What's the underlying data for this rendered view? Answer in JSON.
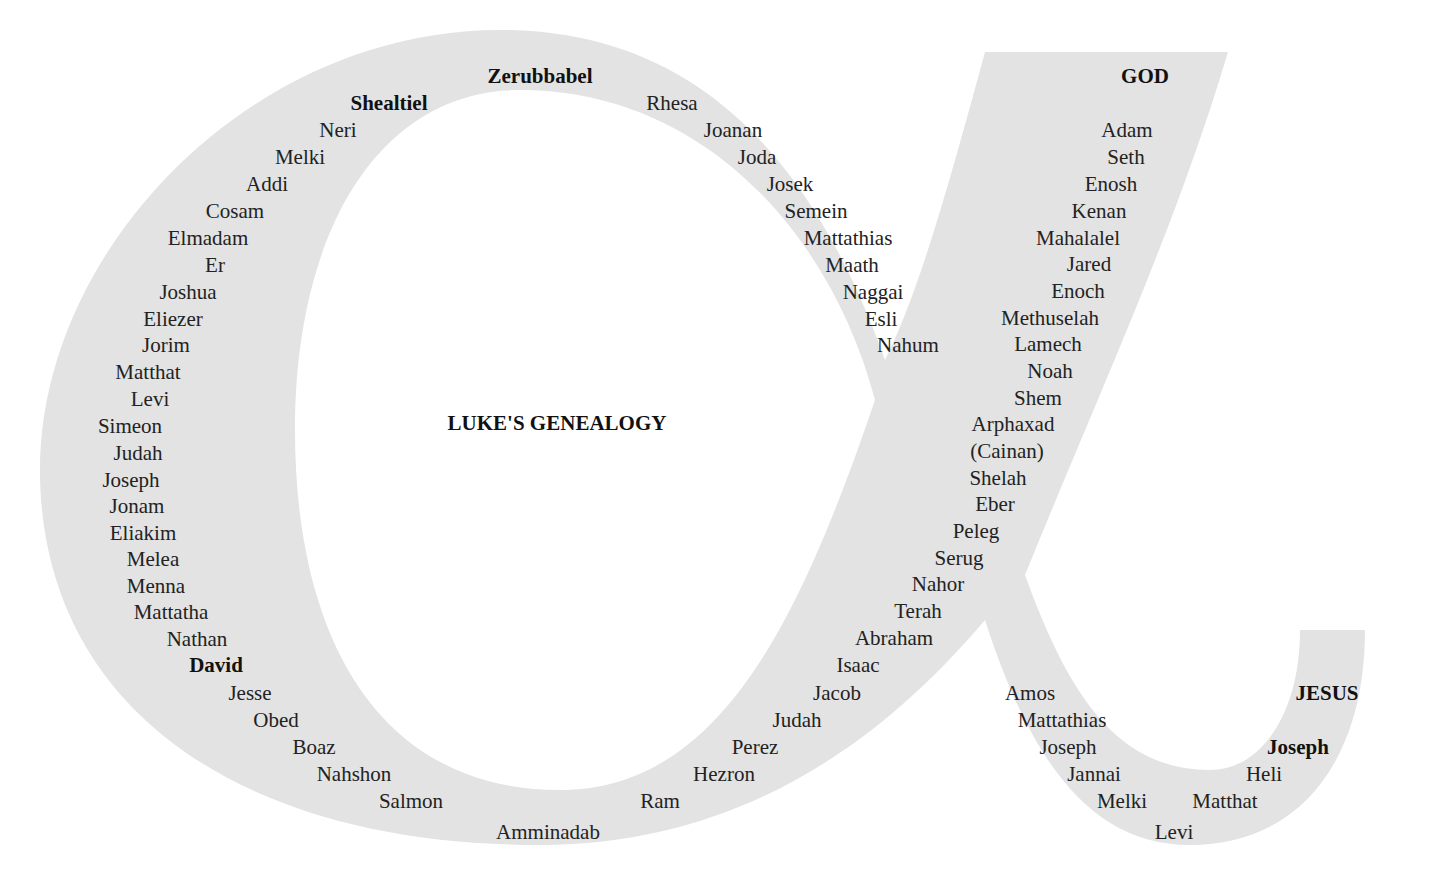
{
  "title": "LUKE'S GENEALOGY",
  "colors": {
    "shape": "#e3e3e3",
    "background": "#ffffff",
    "text": "#222222"
  },
  "names": [
    {
      "text": "Zerubbabel",
      "x": 540,
      "y": 64,
      "bold": true
    },
    {
      "text": "Shealtiel",
      "x": 389,
      "y": 91,
      "bold": true
    },
    {
      "text": "Rhesa",
      "x": 672,
      "y": 91,
      "bold": false
    },
    {
      "text": "Neri",
      "x": 338,
      "y": 118,
      "bold": false
    },
    {
      "text": "Joanan",
      "x": 733,
      "y": 118,
      "bold": false
    },
    {
      "text": "Melki",
      "x": 300,
      "y": 145,
      "bold": false
    },
    {
      "text": "Joda",
      "x": 757,
      "y": 145,
      "bold": false
    },
    {
      "text": "Addi",
      "x": 267,
      "y": 172,
      "bold": false
    },
    {
      "text": "Josek",
      "x": 790,
      "y": 172,
      "bold": false
    },
    {
      "text": "Cosam",
      "x": 235,
      "y": 199,
      "bold": false
    },
    {
      "text": "Semein",
      "x": 816,
      "y": 199,
      "bold": false
    },
    {
      "text": "Elmadam",
      "x": 208,
      "y": 226,
      "bold": false
    },
    {
      "text": "Mattathias",
      "x": 848,
      "y": 226,
      "bold": false
    },
    {
      "text": "Er",
      "x": 215,
      "y": 253,
      "bold": false
    },
    {
      "text": "Maath",
      "x": 852,
      "y": 253,
      "bold": false
    },
    {
      "text": "Joshua",
      "x": 188,
      "y": 280,
      "bold": false
    },
    {
      "text": "Naggai",
      "x": 873,
      "y": 280,
      "bold": false
    },
    {
      "text": "Eliezer",
      "x": 173,
      "y": 307,
      "bold": false
    },
    {
      "text": "Esli",
      "x": 881,
      "y": 307,
      "bold": false
    },
    {
      "text": "Jorim",
      "x": 166,
      "y": 333,
      "bold": false
    },
    {
      "text": "Nahum",
      "x": 908,
      "y": 333,
      "bold": false
    },
    {
      "text": "Matthat",
      "x": 148,
      "y": 360,
      "bold": false
    },
    {
      "text": "Levi",
      "x": 150,
      "y": 387,
      "bold": false
    },
    {
      "text": "Simeon",
      "x": 130,
      "y": 414,
      "bold": false
    },
    {
      "text": "Judah",
      "x": 138,
      "y": 441,
      "bold": false
    },
    {
      "text": "Joseph",
      "x": 131,
      "y": 468,
      "bold": false
    },
    {
      "text": "Jonam",
      "x": 137,
      "y": 494,
      "bold": false
    },
    {
      "text": "Eliakim",
      "x": 143,
      "y": 521,
      "bold": false
    },
    {
      "text": "Melea",
      "x": 153,
      "y": 547,
      "bold": false
    },
    {
      "text": "Menna",
      "x": 156,
      "y": 574,
      "bold": false
    },
    {
      "text": "Mattatha",
      "x": 171,
      "y": 600,
      "bold": false
    },
    {
      "text": "Nathan",
      "x": 197,
      "y": 627,
      "bold": false
    },
    {
      "text": "David",
      "x": 216,
      "y": 653,
      "bold": true
    },
    {
      "text": "Jesse",
      "x": 250,
      "y": 681,
      "bold": false
    },
    {
      "text": "Obed",
      "x": 276,
      "y": 708,
      "bold": false
    },
    {
      "text": "Boaz",
      "x": 314,
      "y": 735,
      "bold": false
    },
    {
      "text": "Nahshon",
      "x": 354,
      "y": 762,
      "bold": false
    },
    {
      "text": "Salmon",
      "x": 411,
      "y": 789,
      "bold": false
    },
    {
      "text": "Amminadab",
      "x": 548,
      "y": 820,
      "bold": false
    },
    {
      "text": "Ram",
      "x": 660,
      "y": 789,
      "bold": false
    },
    {
      "text": "Hezron",
      "x": 724,
      "y": 762,
      "bold": false
    },
    {
      "text": "Perez",
      "x": 755,
      "y": 735,
      "bold": false
    },
    {
      "text": "Judah",
      "x": 797,
      "y": 708,
      "bold": false
    },
    {
      "text": "Jacob",
      "x": 837,
      "y": 681,
      "bold": false
    },
    {
      "text": "Isaac",
      "x": 858,
      "y": 653,
      "bold": false
    },
    {
      "text": "Abraham",
      "x": 894,
      "y": 626,
      "bold": false
    },
    {
      "text": "Terah",
      "x": 918,
      "y": 599,
      "bold": false
    },
    {
      "text": "Nahor",
      "x": 938,
      "y": 572,
      "bold": false
    },
    {
      "text": "Serug",
      "x": 959,
      "y": 546,
      "bold": false
    },
    {
      "text": "Peleg",
      "x": 976,
      "y": 519,
      "bold": false
    },
    {
      "text": "Eber",
      "x": 995,
      "y": 492,
      "bold": false
    },
    {
      "text": "Shelah",
      "x": 998,
      "y": 466,
      "bold": false
    },
    {
      "text": "(Cainan)",
      "x": 1007,
      "y": 439,
      "bold": false
    },
    {
      "text": "Arphaxad",
      "x": 1013,
      "y": 412,
      "bold": false
    },
    {
      "text": "Shem",
      "x": 1038,
      "y": 386,
      "bold": false
    },
    {
      "text": "Noah",
      "x": 1050,
      "y": 359,
      "bold": false
    },
    {
      "text": "Lamech",
      "x": 1048,
      "y": 332,
      "bold": false
    },
    {
      "text": "Methuselah",
      "x": 1050,
      "y": 306,
      "bold": false
    },
    {
      "text": "Enoch",
      "x": 1078,
      "y": 279,
      "bold": false
    },
    {
      "text": "Jared",
      "x": 1089,
      "y": 252,
      "bold": false
    },
    {
      "text": "Mahalalel",
      "x": 1078,
      "y": 226,
      "bold": false
    },
    {
      "text": "Kenan",
      "x": 1099,
      "y": 199,
      "bold": false
    },
    {
      "text": "Enosh",
      "x": 1111,
      "y": 172,
      "bold": false
    },
    {
      "text": "Seth",
      "x": 1126,
      "y": 145,
      "bold": false
    },
    {
      "text": "Adam",
      "x": 1127,
      "y": 118,
      "bold": false
    },
    {
      "text": "GOD",
      "x": 1145,
      "y": 64,
      "bold": true
    },
    {
      "text": "Amos",
      "x": 1030,
      "y": 681,
      "bold": false
    },
    {
      "text": "Mattathias",
      "x": 1062,
      "y": 708,
      "bold": false
    },
    {
      "text": "Joseph",
      "x": 1068,
      "y": 735,
      "bold": false
    },
    {
      "text": "Jannai",
      "x": 1094,
      "y": 762,
      "bold": false
    },
    {
      "text": "Melki",
      "x": 1122,
      "y": 789,
      "bold": false
    },
    {
      "text": "Levi",
      "x": 1174,
      "y": 820,
      "bold": false
    },
    {
      "text": "Matthat",
      "x": 1225,
      "y": 789,
      "bold": false
    },
    {
      "text": "Heli",
      "x": 1264,
      "y": 762,
      "bold": false
    },
    {
      "text": "Joseph",
      "x": 1298,
      "y": 735,
      "bold": true
    },
    {
      "text": "JESUS",
      "x": 1327,
      "y": 681,
      "bold": true
    }
  ]
}
